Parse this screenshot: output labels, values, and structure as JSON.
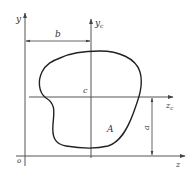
{
  "figure": {
    "colors": {
      "background": "#ffffff",
      "line": "#555555",
      "outline": "#222222",
      "text": "#333333"
    },
    "labels": {
      "y_axis": "y",
      "yc_axis": "y",
      "yc_sub": "c",
      "z_axis": "z",
      "zc_axis": "z",
      "zc_sub": "c",
      "origin": "o",
      "centroid": "c",
      "area": "A",
      "dim_b": "b",
      "dim_a": "a"
    }
  }
}
